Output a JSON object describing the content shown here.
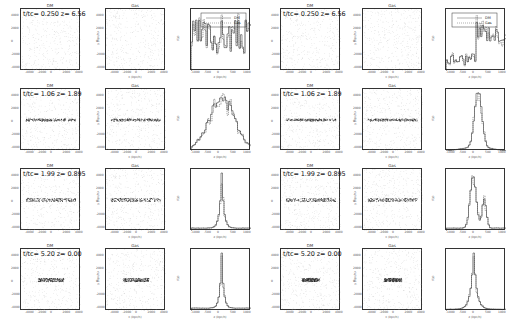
{
  "figure": {
    "columns": [
      {
        "side": "left",
        "panels": [
          "DM",
          "Gas",
          "histogram"
        ]
      },
      {
        "side": "right",
        "panels": [
          "DM",
          "Gas",
          "histogram"
        ]
      }
    ],
    "panel_titles": {
      "dm": "DM",
      "gas": "Gas"
    },
    "scatter_ticks_x": [
      "-4000",
      "-2000",
      "0",
      "2000",
      "4000"
    ],
    "scatter_ticks_y": [
      "4000",
      "2000",
      "0",
      "-2000",
      "-4000"
    ],
    "scatter_xlabel": "x (kpc/h)",
    "scatter_ylabel": "y (kpc/h)",
    "hist_xlabel": "z (kpc/h)",
    "hist_ylabel": "f(z)",
    "hist_ticks_x": [
      "-1000",
      "-500",
      "0",
      "500",
      "1000"
    ],
    "legend": {
      "dm": "DM",
      "gas": "Gas"
    },
    "rows": [
      {
        "label": "t/tc= 0.250 z= 6.56",
        "left_label": "t/tc= 0.250 z= 6.56",
        "right_label": "t/tc= 0.250 z= 6.56"
      },
      {
        "label": "t/tc= 1.06 z= 1.89",
        "left_label": "t/tc= 1.06 z= 1.89",
        "right_label": "t/tc= 1.06 z= 1.89"
      },
      {
        "label": "t/tc= 1.99 z= 0.895",
        "left_label": "t/tc= 1.99 z= 0.895",
        "right_label": "t/tc= 1.99 z= 0.895"
      },
      {
        "label": "t/tc= 5.20 z= 0.00",
        "left_label": "t/tc= 5.20 z= 0.00",
        "right_label": "t/tc= 5.20 z= 0.00"
      }
    ]
  }
}
